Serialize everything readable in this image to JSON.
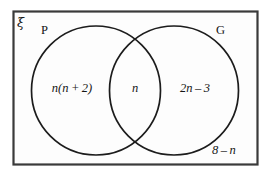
{
  "diagram": {
    "type": "venn-two-set",
    "universal_set_symbol": "ξ",
    "sets": [
      {
        "label": "P",
        "position": "left"
      },
      {
        "label": "G",
        "position": "right"
      }
    ],
    "regions": [
      {
        "name": "p-only",
        "expression": "n(n + 2)"
      },
      {
        "name": "intersection",
        "expression": "n"
      },
      {
        "name": "g-only",
        "expression": "2n – 3"
      },
      {
        "name": "outside",
        "expression": "8 – n"
      }
    ],
    "colors": {
      "frame_stroke": "#3a3a3a",
      "circle_stroke": "#1c1c1c",
      "text": "#151515",
      "background": "#ffffff",
      "frame_fill": "#fdfdfd"
    }
  }
}
